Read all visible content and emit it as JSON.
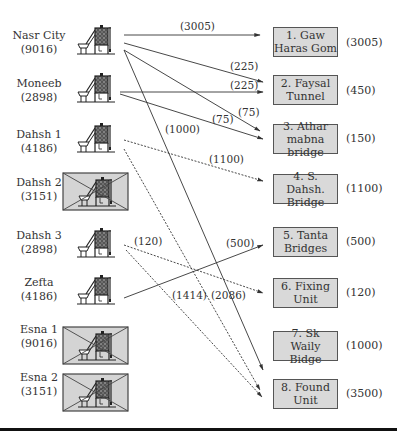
{
  "sources": [
    {
      "name": "Nasr City",
      "capacity": "(9016)",
      "status": "active"
    },
    {
      "name": "Moneeb",
      "capacity": "(2898)",
      "status": "active"
    },
    {
      "name": "Dahsh 1",
      "capacity": "(4186)",
      "status": "active"
    },
    {
      "name": "Dahsh 2",
      "capacity": "(3151)",
      "status": "closed"
    },
    {
      "name": "Dahsh 3",
      "capacity": "(2898)",
      "status": "active"
    },
    {
      "name": "Zefta",
      "capacity": "(4186)",
      "status": "active"
    },
    {
      "name": "Esna 1",
      "capacity": "(9016)",
      "status": "closed"
    },
    {
      "name": "Esna 2",
      "capacity": "(3151)",
      "status": "closed"
    }
  ],
  "destinations": [
    {
      "line1": "1. Gaw",
      "line2": "Haras Gom",
      "demand": "(3005)"
    },
    {
      "line1": "2. Faysal",
      "line2": "Tunnel",
      "demand": "(450)"
    },
    {
      "line1": "3. Athar",
      "line2": "mabna bridge",
      "demand": "(150)"
    },
    {
      "line1": "4. S. Dahsh.",
      "line2": "Bridge",
      "demand": "(1100)"
    },
    {
      "line1": "5. Tanta",
      "line2": "Bridges",
      "demand": "(500)"
    },
    {
      "line1": "6. Fixing",
      "line2": "Unit",
      "demand": "(120)"
    },
    {
      "line1": "7. Sk",
      "line2": "Waily Bidge",
      "demand": "(1000)"
    },
    {
      "line1": "8. Found",
      "line2": "Unit",
      "demand": "(3500)"
    }
  ],
  "flows": [
    {
      "from": "Nasr City",
      "to": "1. Gaw Haras Gom",
      "label": "(3005)",
      "style": "solid"
    },
    {
      "from": "Nasr City",
      "to": "2. Faysal Tunnel",
      "label": "(225)",
      "style": "solid"
    },
    {
      "from": "Nasr City",
      "to": "3. Athar mabna bridge",
      "label": "(75)",
      "style": "solid"
    },
    {
      "from": "Nasr City",
      "to": "7. Sk Waily Bidge",
      "label": "(1000)",
      "style": "solid"
    },
    {
      "from": "Moneeb",
      "to": "2. Faysal Tunnel",
      "label": "(225)",
      "style": "solid"
    },
    {
      "from": "Moneeb",
      "to": "3. Athar mabna bridge",
      "label": "(75)",
      "style": "solid"
    },
    {
      "from": "Dahsh 1",
      "to": "4. S. Dahsh. Bridge",
      "label": "(1100)",
      "style": "dashed"
    },
    {
      "from": "Dahsh 1",
      "to": "8. Found Unit",
      "label": "(2086)",
      "style": "dashed"
    },
    {
      "from": "Dahsh 3",
      "to": "6. Fixing Unit",
      "label": "(120)",
      "style": "dashed"
    },
    {
      "from": "Dahsh 3",
      "to": "8. Found Unit",
      "label": "(1414)",
      "style": "dashed"
    },
    {
      "from": "Zefta",
      "to": "5. Tanta Bridges",
      "label": "(500)",
      "style": "solid"
    }
  ],
  "icons": {
    "plant": "concrete-batch-plant-icon",
    "closed_marker": "cross-out-box"
  },
  "colors": {
    "box_fill": "#d9d9d9",
    "closed_fill": "#d4d4d4",
    "line": "#333333",
    "rule": "#111111"
  }
}
